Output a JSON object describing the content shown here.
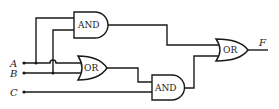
{
  "diagram": {
    "type": "logic-circuit",
    "inputs": [
      {
        "id": "A",
        "label": "A"
      },
      {
        "id": "B",
        "label": "B"
      },
      {
        "id": "C",
        "label": "C"
      }
    ],
    "output": {
      "id": "F",
      "label": "F"
    },
    "gates": [
      {
        "id": "and_top",
        "label": "AND",
        "inputs": [
          "A",
          "B"
        ]
      },
      {
        "id": "or_mid",
        "label": "OR",
        "inputs": [
          "A",
          "B"
        ]
      },
      {
        "id": "and_bottom",
        "label": "AND",
        "inputs": [
          "or_mid",
          "C"
        ]
      },
      {
        "id": "or_final",
        "label": "OR",
        "inputs": [
          "and_top",
          "and_bottom"
        ],
        "output": "F"
      }
    ],
    "expression": "F = AB + (A + B)C"
  },
  "colors": {
    "line": "#1a1a1a",
    "background": "#ffffff"
  }
}
